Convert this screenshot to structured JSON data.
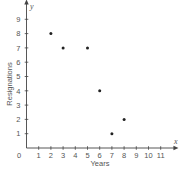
{
  "chart_data": {
    "type": "scatter",
    "title": "",
    "xlabel": "Years",
    "ylabel": "Resignations",
    "x_axis_var": "x",
    "y_axis_var": "y",
    "origin_label": "0",
    "xlim": [
      0,
      11.8
    ],
    "ylim": [
      0,
      9.9
    ],
    "x_ticks": [
      1,
      2,
      3,
      4,
      5,
      6,
      7,
      8,
      9,
      10,
      11
    ],
    "y_ticks": [
      1,
      2,
      3,
      4,
      5,
      6,
      7,
      8,
      9
    ],
    "grid": false,
    "legend": null,
    "points": [
      {
        "x": 2,
        "y": 8
      },
      {
        "x": 3,
        "y": 7
      },
      {
        "x": 5,
        "y": 7
      },
      {
        "x": 6,
        "y": 4
      },
      {
        "x": 7,
        "y": 1
      },
      {
        "x": 8,
        "y": 2
      }
    ],
    "colors": {
      "axis": "#444444",
      "point": "#222222",
      "text": "#555555"
    }
  }
}
